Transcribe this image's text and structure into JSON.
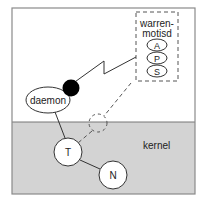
{
  "diagram": {
    "regions": {
      "kernel": {
        "label": "kernel"
      }
    },
    "process_box": {
      "title_line1": "warren-",
      "title_line2": "motisd",
      "items": [
        "A",
        "P",
        "S"
      ]
    },
    "nodes": {
      "daemon": "daemon",
      "t": "T",
      "n": "N"
    },
    "colors": {
      "kernel_fill": "#d3d3d3",
      "border": "#8a8a8a",
      "node_fill": "#ffffff",
      "dot": "#000000"
    }
  }
}
